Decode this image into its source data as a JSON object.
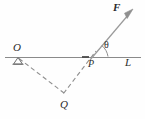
{
  "figure": {
    "type": "geometry-diagram",
    "labels": {
      "O": "O",
      "P": "P",
      "L": "L",
      "Q": "Q",
      "F": "F",
      "theta": "θ"
    },
    "colors": {
      "background": "#fefefe",
      "line": "#8a8a8a",
      "dashed": "#8f8f8f",
      "vector": "#9a9a9a",
      "tick": "#4a4a4a",
      "text": "#2b2b2b"
    },
    "geometry": {
      "line_L": {
        "x1": 5,
        "y1": 57,
        "x2": 141,
        "y2": 57
      },
      "pivot_O": {
        "x": 18,
        "y": 57
      },
      "point_P": {
        "x": 90,
        "y": 60
      },
      "point_Q": {
        "x": 64,
        "y": 93
      },
      "vector_F_tip": {
        "x": 132,
        "y": 11
      },
      "angle_theta_arc_radius": 18,
      "angle_theta_degrees": 49
    }
  }
}
